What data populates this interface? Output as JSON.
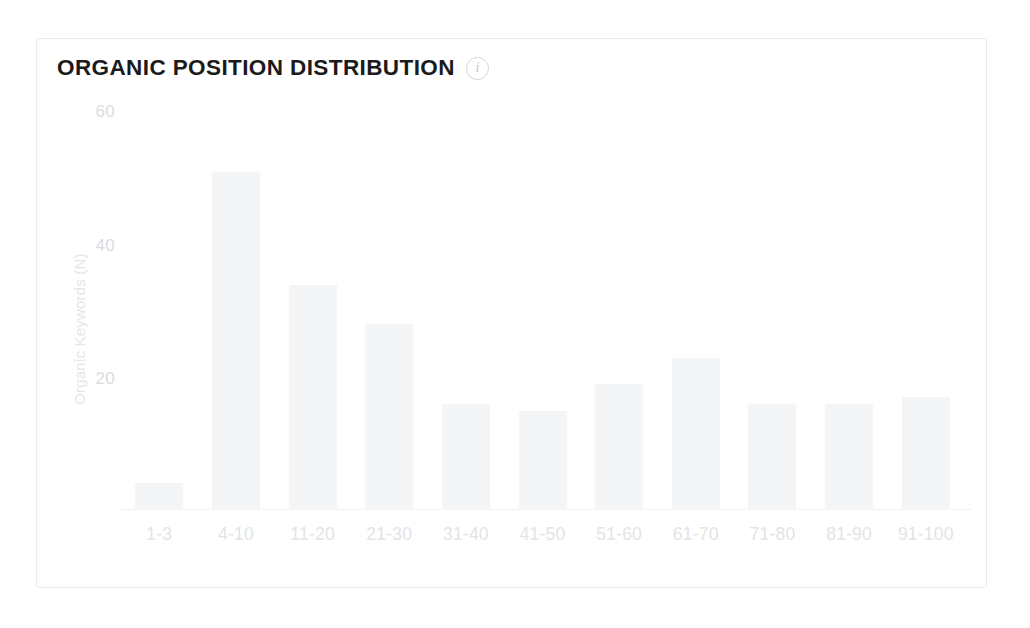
{
  "card": {
    "title": "ORGANIC POSITION DISTRIBUTION",
    "info_icon_glyph": "i",
    "info_icon_name": "info-icon",
    "border_color": "#e9ebed",
    "background_color": "#ffffff"
  },
  "colors": {
    "title_text": "#1b1b1b",
    "bar_fill": "#f4f5f6",
    "tick_text": "#d9dcdf",
    "axis_title_text": "#e4e6e8",
    "x_label_text": "#e2e4e6",
    "axis_line": "#f1f2f3"
  },
  "chart_data": {
    "type": "bar",
    "title": "ORGANIC POSITION DISTRIBUTION",
    "xlabel": "",
    "ylabel": "Organic Keywords (N)",
    "categories": [
      "1-3",
      "4-10",
      "11-20",
      "21-30",
      "31-40",
      "41-50",
      "51-60",
      "61-70",
      "71-80",
      "81-90",
      "91-100"
    ],
    "values": [
      4,
      51,
      34,
      28,
      16,
      15,
      19,
      23,
      16,
      16,
      17
    ],
    "ylim": [
      0,
      62
    ],
    "yticks": [
      20,
      40,
      60
    ],
    "ytick_labels": [
      "20",
      "40",
      "60"
    ],
    "grid": false,
    "legend": "none",
    "series": [
      {
        "name": "Organic Keywords (N)",
        "values": [
          4,
          51,
          34,
          28,
          16,
          15,
          19,
          23,
          16,
          16,
          17
        ]
      }
    ]
  }
}
